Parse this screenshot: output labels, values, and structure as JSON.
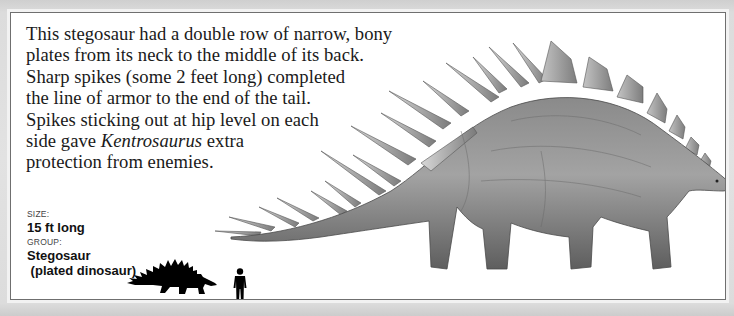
{
  "description": {
    "lines": [
      "This stegosaur had a double row of narrow, bony",
      "plates from its neck to the middle of its back.",
      "Sharp spikes (some 2 feet long) completed",
      "the line of armor to the end of the tail.",
      "Spikes sticking out at hip level on each"
    ],
    "line6_before": "side gave ",
    "line6_italic": "Kentrosaurus",
    "line6_after": " extra",
    "line7": "protection from enemies."
  },
  "facts": {
    "size_label": "SIZE:",
    "size_value": "15 ft long",
    "group_label": "GROUP:",
    "group_value_line1": "Stegosaur",
    "group_value_line2": " (plated dinosaur)"
  },
  "illustration": {
    "subject": "Kentrosaurus",
    "scale_icons": [
      "dinosaur-silhouette-icon",
      "human-silhouette-icon"
    ]
  },
  "colors": {
    "frame": "#dcdcdc",
    "card": "#ffffff",
    "card_border": "#6f6f6f",
    "text": "#1a1a1a"
  }
}
